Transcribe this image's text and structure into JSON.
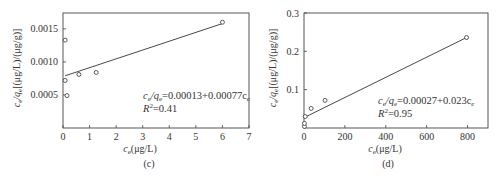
{
  "chart_data": [
    {
      "type": "scatter",
      "panel_label": "(c)",
      "xlabel": "c_e(μg/L)",
      "ylabel": "c_e/q_e[(μg/L)/(μg/g)]",
      "xlim": [
        0,
        7
      ],
      "ylim": [
        0,
        0.00174
      ],
      "xticks": [
        "0",
        "1",
        "2",
        "3",
        "4",
        "5",
        "6",
        "7"
      ],
      "yticks": [
        {
          "v": 0.0005,
          "label": "0.0005"
        },
        {
          "v": 0.001,
          "label": "0.0010"
        },
        {
          "v": 0.0015,
          "label": "0.0015"
        }
      ],
      "points": [
        {
          "x": 0.08,
          "y": 0.00133
        },
        {
          "x": 0.08,
          "y": 0.00072
        },
        {
          "x": 0.15,
          "y": 0.00049
        },
        {
          "x": 0.6,
          "y": 0.00081
        },
        {
          "x": 1.25,
          "y": 0.00084
        },
        {
          "x": 6.0,
          "y": 0.0016
        }
      ],
      "fit_line": {
        "x0": 0.08,
        "y0": 0.00079,
        "x1": 6.0,
        "y1": 0.00158
      },
      "equation": "c_e/q_e=0.00013+0.00077c_e",
      "r2": "R²=0.41",
      "grid": false
    },
    {
      "type": "scatter",
      "panel_label": "(d)",
      "xlabel": "c_e(μg/L)",
      "ylabel": "c_e/q_e[(μg/L)/(μg/g)]",
      "xlim": [
        0,
        900
      ],
      "ylim": [
        0,
        0.3
      ],
      "xticks": [
        "0",
        "200",
        "400",
        "600",
        "800"
      ],
      "yticks": [
        {
          "v": 0.1,
          "label": "0.1"
        },
        {
          "v": 0.2,
          "label": "0.2"
        },
        {
          "v": 0.3,
          "label": "0.3"
        }
      ],
      "points": [
        {
          "x": 2,
          "y": 0.004
        },
        {
          "x": 2,
          "y": 0.012
        },
        {
          "x": 6,
          "y": 0.03
        },
        {
          "x": 35,
          "y": 0.051
        },
        {
          "x": 103,
          "y": 0.072
        },
        {
          "x": 795,
          "y": 0.236
        }
      ],
      "fit_line": {
        "x0": 0,
        "y0": 0.027,
        "x1": 795,
        "y1": 0.236
      },
      "equation": "c_e/q_e=0.00027+0.023c_e",
      "r2": "R²=0.95",
      "grid": false
    }
  ],
  "labels": {
    "c": {
      "panel": "(c)",
      "xlabel_main": "c",
      "xlabel_sub": "e",
      "xlabel_rest": "(μg/L)",
      "eq_a": "c",
      "eq_a_sub": "e",
      "eq_mid": "/q",
      "eq_mid_sub": "e",
      "eq_rest": "=0.00013+0.00077c",
      "eq_end_sub": "e",
      "r2_main": "R",
      "r2_sup": "2",
      "r2_rest": "=0.41",
      "y_a": "c",
      "y_a_sub": "e",
      "y_mid": "/q",
      "y_mid_sub": "e",
      "y_rest": "[(μg/L)/(μg/g)]"
    },
    "d": {
      "panel": "(d)",
      "xlabel_main": "c",
      "xlabel_sub": "e",
      "xlabel_rest": "(μg/L)",
      "eq_a": "c",
      "eq_a_sub": "e",
      "eq_mid": "/q",
      "eq_mid_sub": "e",
      "eq_rest": "=0.00027+0.023c",
      "eq_end_sub": "e",
      "r2_main": "R",
      "r2_sup": "2",
      "r2_rest": "=0.95",
      "y_a": "c",
      "y_a_sub": "e",
      "y_mid": "/q",
      "y_mid_sub": "e",
      "y_rest": "[(μg/L)/(μg/g)]"
    }
  }
}
